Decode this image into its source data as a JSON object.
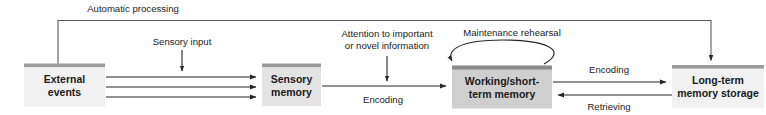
{
  "diagram": {
    "colors": {
      "canvas": "#ffffff",
      "node_fill_light": "#f1f1f1",
      "node_fill_dark": "#cfcfcf",
      "node_cap": "#9a9a9a",
      "node_cap_dark": "#8a8a8a",
      "arrow": "#262626",
      "text": "#1b1b1b"
    },
    "nodes": [
      {
        "id": "external-events",
        "line1": "External",
        "line2": "events",
        "shade": "light"
      },
      {
        "id": "sensory-memory",
        "line1": "Sensory",
        "line2": "memory",
        "shade": "light"
      },
      {
        "id": "working-memory",
        "line1": "Working/short-",
        "line2": "term memory",
        "shade": "dark"
      },
      {
        "id": "long-term-memory",
        "line1": "Long-term",
        "line2": "memory storage",
        "shade": "light"
      }
    ],
    "labels": {
      "automatic_processing": "Automatic processing",
      "sensory_input": "Sensory input",
      "attention_line1": "Attention to important",
      "attention_line2": "or novel information",
      "maintenance_rehearsal": "Maintenance rehearsal",
      "encoding_sensory_to_working": "Encoding",
      "encoding_working_to_longterm": "Encoding",
      "retrieving": "Retrieving"
    }
  }
}
